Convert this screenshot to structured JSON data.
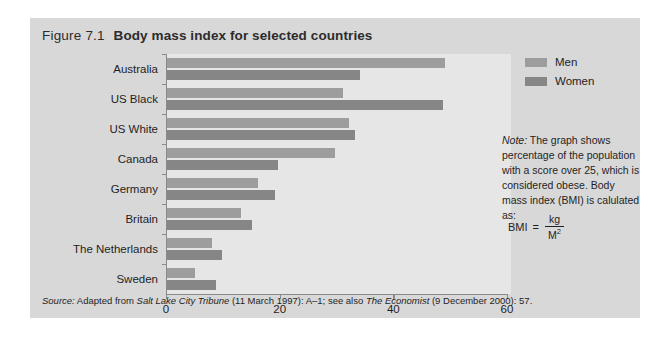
{
  "figure": {
    "label": "Figure 7.1",
    "caption": "Body mass index for selected countries"
  },
  "legend": {
    "items": [
      {
        "label": "Men",
        "color": "#9d9d9d"
      },
      {
        "label": "Women",
        "color": "#868686"
      }
    ]
  },
  "note": {
    "lead": "Note:",
    "text": " The graph shows percentage of the population with a score over 25, which is considered obese. Body mass index (BMI) is calulated as:"
  },
  "formula": {
    "lhs": "BMI",
    "equals": "=",
    "numerator": "kg",
    "denominator_base": "M",
    "denominator_exp": "2"
  },
  "source": {
    "lead": "Source:",
    "part1": " Adapted from ",
    "italic1": "Salt Lake City Tribune",
    "part2": " (11 March 1997): A–1; see also ",
    "italic2": "The Economist",
    "part3": " (9 December 2000): 57."
  },
  "chart_data": {
    "type": "bar",
    "orientation": "horizontal",
    "title": "Body mass index for selected countries",
    "xlabel": "",
    "ylabel": "",
    "xlim": [
      0,
      60
    ],
    "xticks": [
      0,
      20,
      40,
      60
    ],
    "grid": false,
    "legend_position": "top-right",
    "categories": [
      "Australia",
      "US Black",
      "US White",
      "Canada",
      "Germany",
      "Britain",
      "The Netherlands",
      "Sweden"
    ],
    "series": [
      {
        "name": "Men",
        "color": "#9d9d9d",
        "values": [
          49,
          31,
          32,
          29.5,
          16,
          13,
          8,
          5
        ]
      },
      {
        "name": "Women",
        "color": "#868686",
        "values": [
          34,
          48.5,
          33,
          19.5,
          19,
          15,
          9.7,
          8.7
        ]
      }
    ]
  }
}
